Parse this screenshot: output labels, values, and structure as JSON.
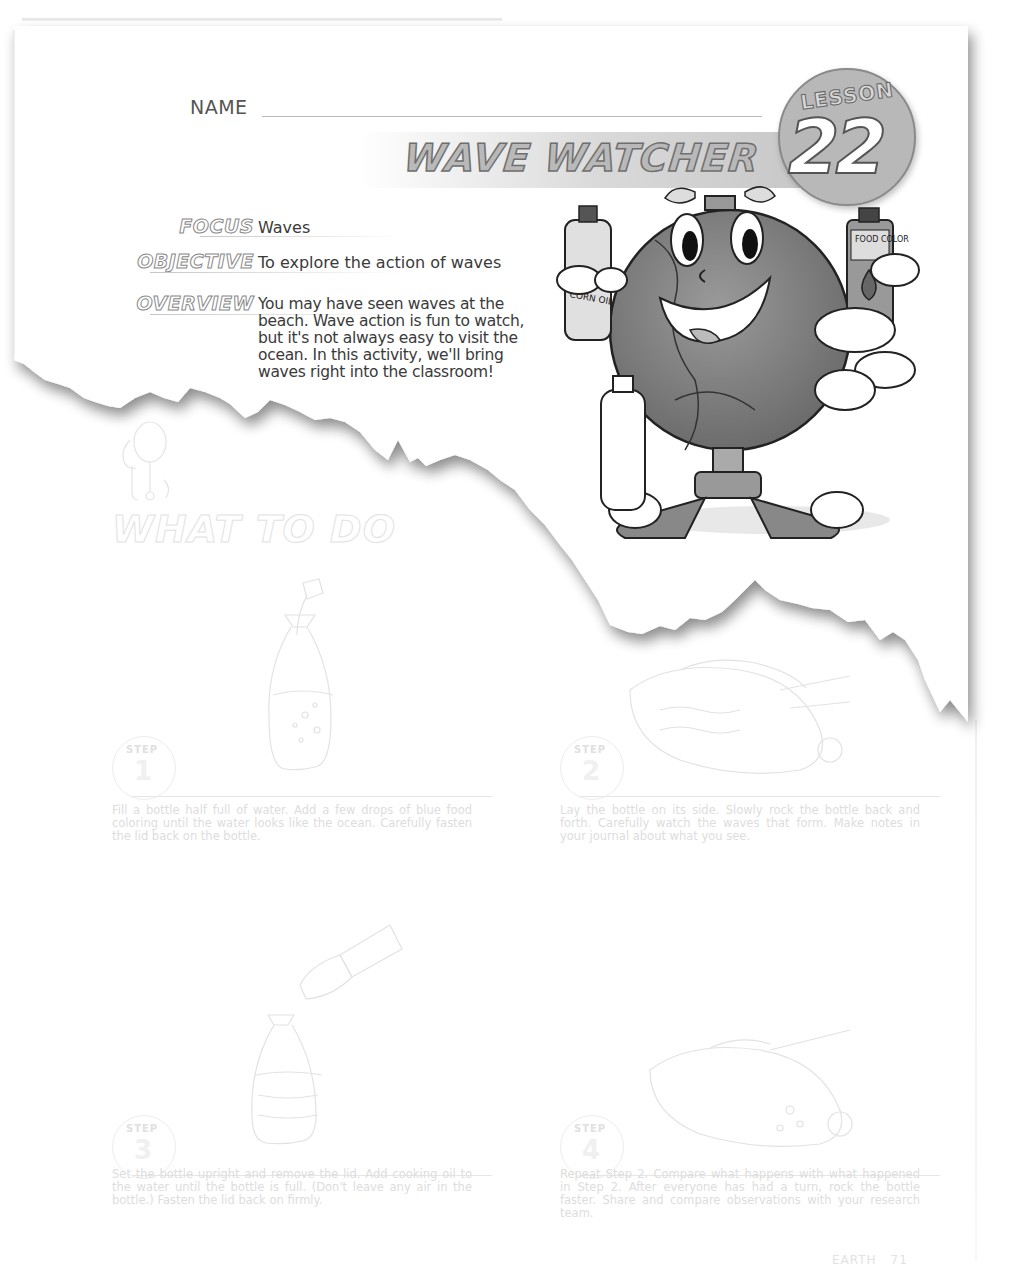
{
  "header": {
    "name_label": "NAME",
    "title": "WAVE WATCHER",
    "lesson_word": "LESSON",
    "lesson_number": "22"
  },
  "fields": [
    {
      "label": "FOCUS",
      "value": "Waves"
    },
    {
      "label": "OBJECTIVE",
      "value": "To explore the action of waves"
    },
    {
      "label": "OVERVIEW",
      "value": "You may have seen waves at the beach. Wave action is fun to watch, but it's not always easy to visit the ocean. In this activity, we'll bring waves right into the classroom!"
    }
  ],
  "illustration": {
    "bottle_left_label": "CORN OIL",
    "bottle_right_label": "FOOD COLOR"
  },
  "what_to_do": {
    "heading": "WHAT TO DO",
    "step_label": "STEP",
    "steps": [
      {
        "number": "1",
        "text": "Fill a bottle half full of water. Add a few drops of blue food coloring until the water looks like the ocean. Carefully fasten the lid back on the bottle."
      },
      {
        "number": "2",
        "text": "Lay the bottle on its side. Slowly rock the bottle back and forth. Carefully watch the waves that form. Make notes in your journal about what you see."
      },
      {
        "number": "3",
        "text": "Set the bottle upright and remove the lid. Add cooking oil to the water until the bottle is full. (Don't leave any air in the bottle.) Fasten the lid back on firmly."
      },
      {
        "number": "4",
        "text": "Repeat Step 2. Compare what happens with what happened in Step 2. After everyone has had a turn, rock the bottle faster. Share and compare observations with your research team."
      }
    ]
  },
  "footer": {
    "subject": "EARTH",
    "page": "71"
  },
  "colors": {
    "ink": "#3a3a3a",
    "faded_ink": "#dddddd",
    "badge_gray": "#b8b8b8"
  }
}
